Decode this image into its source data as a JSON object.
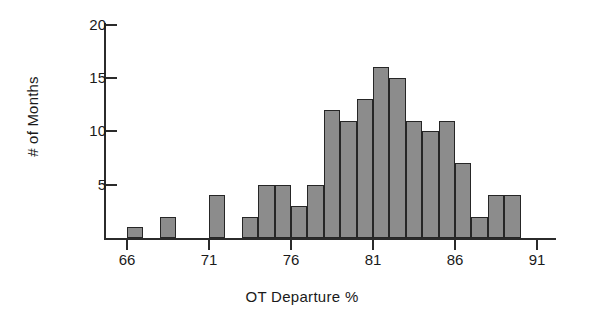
{
  "chart_data": {
    "type": "bar",
    "title": "",
    "subtitle": "",
    "xlabel": "OT Departure %",
    "ylabel": "# of Months",
    "xlim": [
      65,
      92
    ],
    "ylim": [
      0,
      21
    ],
    "grid": false,
    "legend": null,
    "bin_width": 1,
    "x_ticks": [
      66,
      71,
      76,
      81,
      86,
      91
    ],
    "x_tick_labels": [
      "66",
      "71",
      "76",
      "81",
      "86",
      "91"
    ],
    "y_ticks": [
      5,
      10,
      15,
      20
    ],
    "y_tick_labels": [
      "5",
      "10",
      "15",
      "20"
    ],
    "bar_color": "#8c8c8c",
    "bar_edge_color": "#262626",
    "axis_color": "#2b2b2b",
    "categories": [
      66,
      68,
      71,
      73,
      74,
      75,
      76,
      77,
      78,
      79,
      80,
      81,
      82,
      83,
      84,
      85,
      86,
      87,
      88,
      89
    ],
    "values": [
      1,
      2,
      4,
      2,
      5,
      5,
      3,
      5,
      12,
      11,
      13,
      16,
      15,
      11,
      10,
      11,
      7,
      2,
      4,
      4
    ],
    "bars": [
      {
        "bin_start": 66,
        "bin_end": 67,
        "count": 1
      },
      {
        "bin_start": 68,
        "bin_end": 69,
        "count": 2
      },
      {
        "bin_start": 71,
        "bin_end": 72,
        "count": 4
      },
      {
        "bin_start": 73,
        "bin_end": 74,
        "count": 2
      },
      {
        "bin_start": 74,
        "bin_end": 75,
        "count": 5
      },
      {
        "bin_start": 75,
        "bin_end": 76,
        "count": 5
      },
      {
        "bin_start": 76,
        "bin_end": 77,
        "count": 3
      },
      {
        "bin_start": 77,
        "bin_end": 78,
        "count": 5
      },
      {
        "bin_start": 78,
        "bin_end": 79,
        "count": 12
      },
      {
        "bin_start": 79,
        "bin_end": 80,
        "count": 11
      },
      {
        "bin_start": 80,
        "bin_end": 81,
        "count": 13
      },
      {
        "bin_start": 81,
        "bin_end": 82,
        "count": 16
      },
      {
        "bin_start": 82,
        "bin_end": 83,
        "count": 15
      },
      {
        "bin_start": 83,
        "bin_end": 84,
        "count": 11
      },
      {
        "bin_start": 84,
        "bin_end": 85,
        "count": 10
      },
      {
        "bin_start": 85,
        "bin_end": 86,
        "count": 11
      },
      {
        "bin_start": 86,
        "bin_end": 87,
        "count": 7
      },
      {
        "bin_start": 87,
        "bin_end": 88,
        "count": 2
      },
      {
        "bin_start": 88,
        "bin_end": 89,
        "count": 4
      },
      {
        "bin_start": 89,
        "bin_end": 90,
        "count": 4
      }
    ]
  }
}
